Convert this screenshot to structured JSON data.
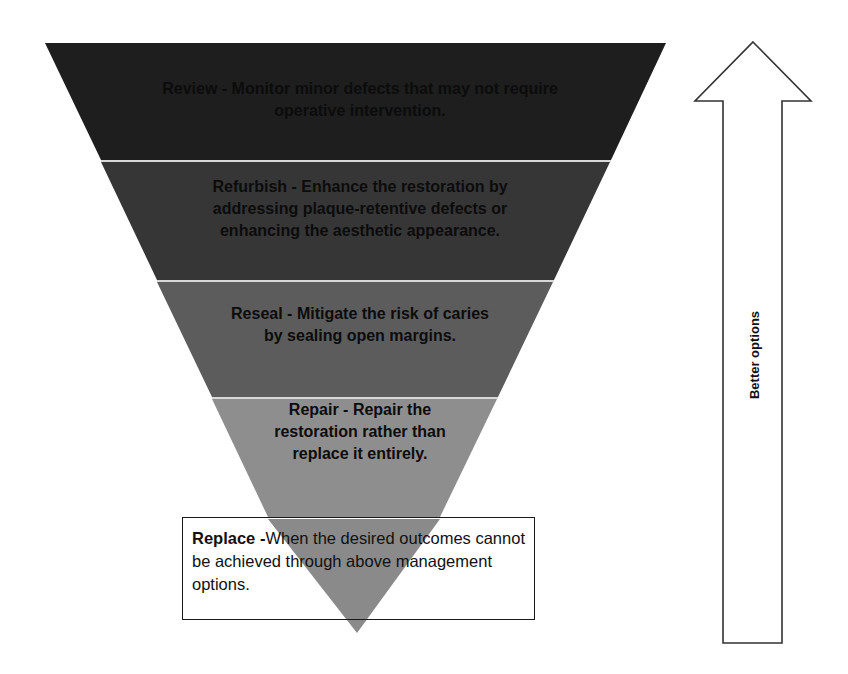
{
  "diagram": {
    "type": "inverted-pyramid",
    "colors": {
      "review": "#1e1e1e",
      "refurbish": "#363636",
      "reseal": "#5c5c5c",
      "repair": "#8e8e8e",
      "apex": "#8a8a8a",
      "separator": "#d8d8d8",
      "text": "#0c0c0c",
      "box_border": "#1a1a1a",
      "arrow_stroke": "#333333"
    },
    "levels": [
      {
        "id": "review",
        "title": "Review",
        "separator": " - ",
        "description": "Monitor minor defects that may not require operative intervention."
      },
      {
        "id": "refurbish",
        "title": "Refurbish",
        "separator": " - ",
        "description": "Enhance the restoration by addressing plaque-retentive defects or enhancing the aesthetic appearance."
      },
      {
        "id": "reseal",
        "title": "Reseal",
        "separator": " - ",
        "description": "Mitigate the risk of caries by sealing open margins."
      },
      {
        "id": "repair",
        "title": "Repair",
        "separator": " - ",
        "description": "Repair the restoration rather than replace it entirely."
      },
      {
        "id": "replace",
        "title": "Replace",
        "separator": " -",
        "description": "When the desired outcomes cannot be achieved through above management options."
      }
    ],
    "arrow": {
      "direction": "up",
      "label": "Better options"
    }
  }
}
